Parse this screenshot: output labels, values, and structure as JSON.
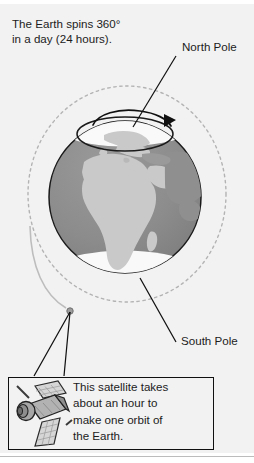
{
  "figure": {
    "intro_text": "The Earth spins 360°\nin a day (24 hours).",
    "north_pole_label": "North Pole",
    "south_pole_label": "South Pole",
    "satellite_note": "This satellite takes\nabout an hour to\nmake one orbit of\nthe Earth.",
    "icons": {
      "satellite": "satellite-icon",
      "rotation_arrow": "rotation-arrow-icon",
      "globe": "earth-globe-icon",
      "orbit": "orbit-path-icon",
      "satellite_dot": "satellite-position-dot"
    },
    "colors": {
      "background": "#f2f2f2",
      "ocean": "#8a8a8a",
      "land": "#c9c9c9",
      "ice_cap": "#ffffff",
      "outline": "#1a1a1a",
      "orbit_dash": "#b0b0b0",
      "text": "#1c1c1c",
      "satellite_body": "#a8a8a8",
      "satellite_panel": "#d8d8d8",
      "page": "#ffffff",
      "rule": "#bcbcbc"
    }
  }
}
